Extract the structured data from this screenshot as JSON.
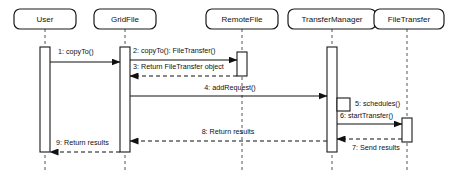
{
  "diagram": {
    "type": "uml-sequence-diagram",
    "title": "",
    "width": 472,
    "height": 181,
    "background_color": "#ffffff",
    "line_color": "#111111",
    "box_border_color": "#1a1a1a",
    "lifeline_dash_color": "#555555"
  },
  "participants": [
    {
      "id": "user",
      "label": "User",
      "x": 45,
      "box": {
        "x": 14,
        "y": 9,
        "width": 62,
        "height": 20,
        "rx": 6
      },
      "lifeline": {
        "top": 29,
        "bottom": 172
      },
      "activation": {
        "x": 40,
        "y": 47,
        "width": 10,
        "height": 105
      }
    },
    {
      "id": "gridfile",
      "label": "GridFile",
      "x": 125,
      "box": {
        "x": 94,
        "y": 9,
        "width": 62,
        "height": 20,
        "rx": 6
      },
      "lifeline": {
        "top": 29,
        "bottom": 172
      },
      "activation": {
        "x": 120,
        "y": 47,
        "width": 10,
        "height": 105
      }
    },
    {
      "id": "remotefile",
      "label": "RemoteFile",
      "x": 242,
      "box": {
        "x": 206,
        "y": 9,
        "width": 72,
        "height": 20,
        "rx": 6
      },
      "lifeline": {
        "top": 29,
        "bottom": 172
      },
      "activation": {
        "x": 237,
        "y": 52,
        "width": 10,
        "height": 24
      }
    },
    {
      "id": "transfermanager",
      "label": "TransferManager",
      "x": 332,
      "box": {
        "x": 288,
        "y": 9,
        "width": 88,
        "height": 20,
        "rx": 6
      },
      "lifeline": {
        "top": 29,
        "bottom": 172
      },
      "activation": {
        "x": 327,
        "y": 47,
        "width": 10,
        "height": 105
      }
    },
    {
      "id": "filetransfer",
      "label": "FileTransfer",
      "x": 407,
      "box": {
        "x": 374,
        "y": 9,
        "width": 70,
        "height": 20,
        "rx": 6
      },
      "lifeline": {
        "top": 29,
        "bottom": 172
      },
      "activation": {
        "x": 402,
        "y": 118,
        "width": 10,
        "height": 24
      }
    }
  ],
  "messages": [
    {
      "number": "1",
      "label": "1: copyTo()",
      "from": "user",
      "to": "gridfile",
      "style": "solid",
      "direction": "right",
      "y": 62,
      "x1": 50,
      "x2": 120,
      "label_x": 58,
      "label_y": 52,
      "label_anchor": "start"
    },
    {
      "number": "2",
      "label": "2: copyTo(): FileTransfer()",
      "from": "gridfile",
      "to": "remotefile",
      "style": "solid",
      "direction": "right",
      "y": 60,
      "x1": 130,
      "x2": 237,
      "label_x": 133,
      "label_y": 51,
      "label_anchor": "start"
    },
    {
      "number": "3",
      "label": "3: Return FileTransfer object",
      "from": "remotefile",
      "to": "gridfile",
      "style": "dashed",
      "direction": "left",
      "y": 76,
      "x1": 237,
      "x2": 130,
      "label_x": 133,
      "label_y": 67,
      "label_anchor": "start"
    },
    {
      "number": "4",
      "label": "4: addRequest()",
      "from": "gridfile",
      "to": "transfermanager",
      "style": "solid",
      "direction": "right",
      "y": 96,
      "x1": 130,
      "x2": 327,
      "label_x": 230,
      "label_y": 88,
      "label_anchor": "middle"
    },
    {
      "number": "5",
      "label": "5: schedules()",
      "from": "transfermanager",
      "to": "transfermanager",
      "style": "self",
      "direction": "self",
      "y": 106,
      "selfbox": {
        "x": 337,
        "y": 98,
        "width": 13,
        "height": 13
      },
      "label_x": 355,
      "label_y": 104,
      "label_anchor": "start"
    },
    {
      "number": "6",
      "label": "6: startTransfer()",
      "from": "transfermanager",
      "to": "filetransfer",
      "style": "solid",
      "direction": "right",
      "y": 124,
      "x1": 337,
      "x2": 402,
      "label_x": 340,
      "label_y": 116,
      "label_anchor": "start"
    },
    {
      "number": "7",
      "label": "7: Send results",
      "from": "filetransfer",
      "to": "transfermanager",
      "style": "dashed",
      "direction": "left",
      "y": 139,
      "x1": 402,
      "x2": 337,
      "label_x": 352,
      "label_y": 148,
      "label_anchor": "start"
    },
    {
      "number": "8",
      "label": "8: Return results",
      "from": "transfermanager",
      "to": "gridfile",
      "style": "dashed",
      "direction": "left",
      "y": 141,
      "x1": 327,
      "x2": 130,
      "label_x": 228,
      "label_y": 132,
      "label_anchor": "middle"
    },
    {
      "number": "9",
      "label": "9: Return results",
      "from": "gridfile",
      "to": "user",
      "style": "dashed",
      "direction": "left",
      "y": 152,
      "x1": 120,
      "x2": 50,
      "label_x": 56,
      "label_y": 143,
      "label_anchor": "start"
    }
  ]
}
